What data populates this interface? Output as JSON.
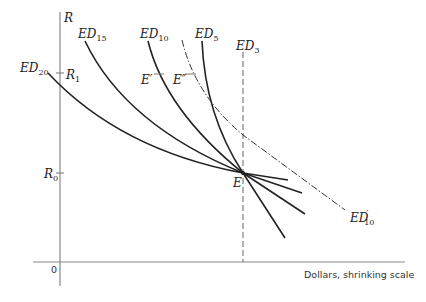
{
  "diagram": {
    "axes": {
      "y_label": "R",
      "origin_label": "0",
      "x_label": "Dollars, shrinking scale",
      "y_ticks": [
        {
          "base": "R",
          "sub": "1"
        },
        {
          "base": "R",
          "sub": "0"
        }
      ]
    },
    "curves": [
      {
        "id": "ED20",
        "base": "ED",
        "sub": "20",
        "style": "solid"
      },
      {
        "id": "ED15",
        "base": "ED",
        "sub": "15",
        "style": "solid"
      },
      {
        "id": "ED10",
        "base": "ED",
        "sub": "10",
        "style": "solid"
      },
      {
        "id": "ED5",
        "base": "ED",
        "sub": "5",
        "style": "solid"
      },
      {
        "id": "ED3",
        "base": "ED",
        "sub": "3",
        "style": "dashed-vertical"
      },
      {
        "id": "ED10prime",
        "base": "ED",
        "prime": "′",
        "sub": "10",
        "style": "dash-dot"
      }
    ],
    "points": {
      "E": "E",
      "E_prime": "E′",
      "E_double_prime": "E″"
    }
  }
}
